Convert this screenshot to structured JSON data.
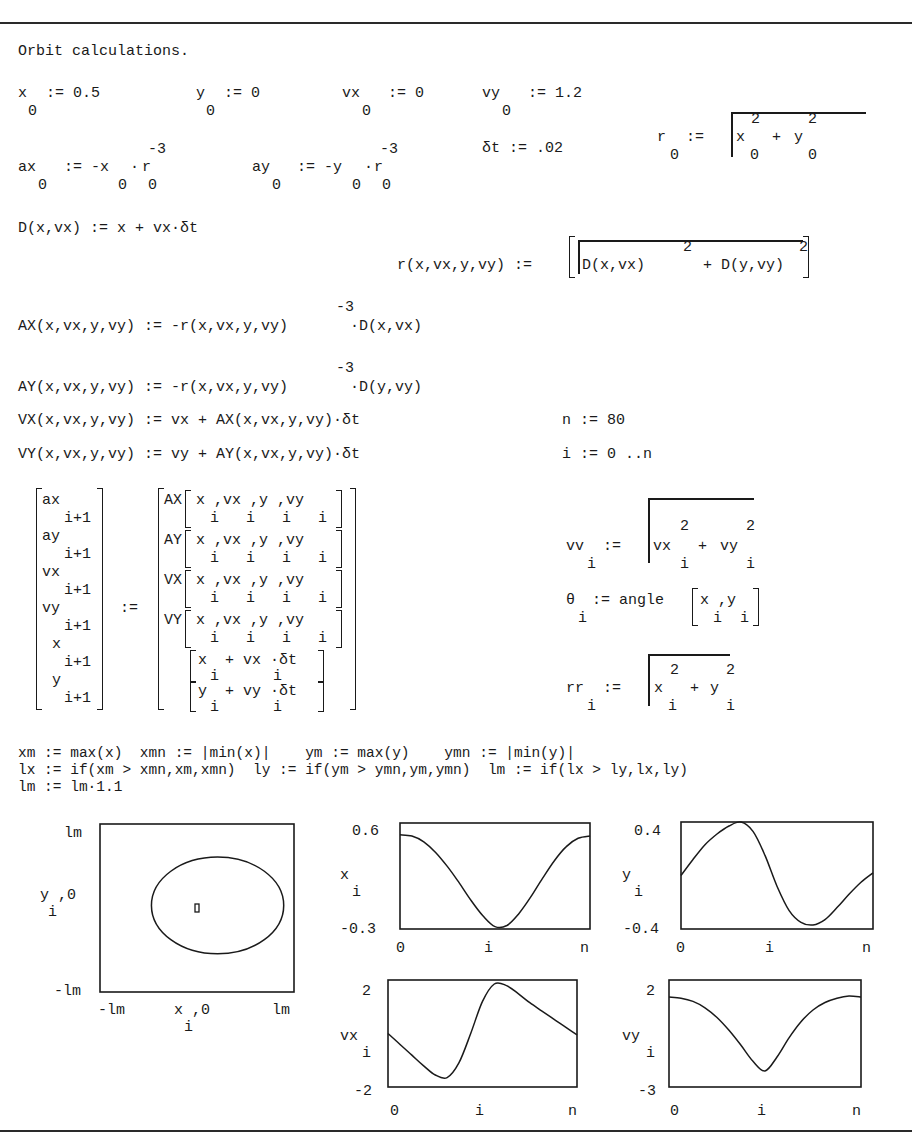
{
  "title": "Orbit calculations.",
  "init": {
    "x0": {
      "name": "x",
      "sub": "0",
      "op": ":= 0.5"
    },
    "y0": {
      "name": "y",
      "sub": "0",
      "op": ":= 0"
    },
    "vx0": {
      "name": "vx",
      "sub": "0",
      "op": ":= 0"
    },
    "vy0": {
      "name": "vy",
      "sub": "0",
      "op": ":= 1.2"
    },
    "r0": {
      "name": "r",
      "sub": "0",
      "op": ":=",
      "term1": "x",
      "term1_sub": "0",
      "term1_sup": "2",
      "plus": "+",
      "term2": "y",
      "term2_sub": "0",
      "term2_sup": "2"
    },
    "dt": "δt := .02",
    "ax0": {
      "name": "ax",
      "sub": "0",
      "body": ":= -x",
      "xsub": "0",
      "dot": "·",
      "r": "r",
      "rsub": "0",
      "exp": "-3"
    },
    "ay0": {
      "name": "ay",
      "sub": "0",
      "body": ":= -y",
      "ysub": "0",
      "dot": "·",
      "r": "r",
      "rsub": "0",
      "exp": "-3"
    }
  },
  "functions": {
    "D": "D(x,vx) := x + vx·δt",
    "r_lhs": "r(x,vx,y,vy) :=",
    "r_t1": "D(x,vx)",
    "r_t2": "+ D(y,vy)",
    "r_sup": "2",
    "AX_lhs": "AX(x,vx,y,vy) := -r(x,vx,y,vy)",
    "AX_rhs": "·D(x,vx)",
    "AY_lhs": "AY(x,vx,y,vy) := -r(x,vx,y,vy)",
    "AY_rhs": "·D(y,vy)",
    "exp": "-3",
    "VX": "VX(x,vx,y,vy) := vx + AX(x,vx,y,vy)·δt",
    "VY": "VY(x,vx,y,vy) := vy + AY(x,vx,y,vy)·δt",
    "n_def": "n := 80",
    "i_def": "i := 0 ..n"
  },
  "matrix": {
    "lhs": [
      "ax",
      "ay",
      "vx",
      "vy",
      "x",
      "y"
    ],
    "lhs_sub": "i+1",
    "assign": ":=",
    "rhs_fn": [
      "AX",
      "AY",
      "VX",
      "VY"
    ],
    "rhs_args": "x ,vx ,y ,vy",
    "rhs_args_sub": "i   i   i   i",
    "rhs_x": "x  + vx ·δt",
    "rhs_y": "y  + vy ·δt",
    "rhs_xy_sub": "i      i"
  },
  "derived": {
    "vv": {
      "name": "vv",
      "sub": "i",
      "op": ":=",
      "t1": "vx",
      "t2": "vy",
      "sup": "2",
      "plus": "+"
    },
    "theta": {
      "name": "θ",
      "sub": "i",
      "op": ":= angle",
      "args": "x ,y",
      "args_sub": "i  i"
    },
    "rr": {
      "name": "rr",
      "sub": "i",
      "op": ":=",
      "t1": "x",
      "t2": "y",
      "sup": "2",
      "plus": "+"
    }
  },
  "limits": {
    "line1": "xm := max(x)  xmn := |min(x)|    ym := max(y)    ymn := |min(y)|",
    "line2": "lx := if(xm > xmn,xm,xmn)  ly := if(ym > ymn,ym,ymn)  lm := if(lx > ly,lx,ly)",
    "line3": "lm := lm·1.1"
  },
  "chart_data": [
    {
      "type": "scatter",
      "title": "orbit",
      "xlabel": "x_i ,0",
      "ylabel": "y_i ,0",
      "xlim": [
        -0.66,
        0.66
      ],
      "ylim": [
        -0.66,
        0.66
      ],
      "xticks": [
        "-lm",
        "lm"
      ],
      "yticks": [
        "lm",
        "-lm"
      ],
      "series": [
        {
          "name": "orbit",
          "shape": "ellipse",
          "cx": 0.14,
          "cy": 0.02,
          "rx": 0.45,
          "ry": 0.38
        },
        {
          "name": "origin",
          "shape": "marker",
          "x": 0,
          "y": 0
        }
      ]
    },
    {
      "type": "line",
      "title": "x vs i",
      "xlabel": "i",
      "ylabel": "x_i",
      "xticks": [
        "0",
        "i",
        "n"
      ],
      "ylim": [
        -0.3,
        0.6
      ],
      "ytick_labels": [
        "0.6",
        "-0.3"
      ],
      "x": [
        0,
        5,
        10,
        15,
        20,
        25,
        30,
        35,
        40,
        45,
        50,
        55,
        60,
        65,
        70,
        75,
        80
      ],
      "values": [
        0.5,
        0.49,
        0.44,
        0.35,
        0.23,
        0.09,
        -0.06,
        -0.19,
        -0.28,
        -0.27,
        -0.17,
        -0.03,
        0.13,
        0.28,
        0.4,
        0.47,
        0.49
      ]
    },
    {
      "type": "line",
      "title": "y vs i",
      "xlabel": "i",
      "ylabel": "y_i",
      "xticks": [
        "0",
        "i",
        "n"
      ],
      "ylim": [
        -0.4,
        0.4
      ],
      "ytick_labels": [
        "0.4",
        "-0.4"
      ],
      "x": [
        0,
        5,
        10,
        15,
        20,
        25,
        30,
        35,
        40,
        45,
        50,
        55,
        60,
        65,
        70,
        75,
        80
      ],
      "values": [
        0.0,
        0.12,
        0.23,
        0.31,
        0.37,
        0.4,
        0.33,
        0.15,
        -0.08,
        -0.26,
        -0.35,
        -0.37,
        -0.33,
        -0.24,
        -0.14,
        -0.05,
        0.02
      ]
    },
    {
      "type": "line",
      "title": "vx vs i",
      "xlabel": "i",
      "ylabel": "vx_i",
      "xticks": [
        "0",
        "i",
        "n"
      ],
      "ylim": [
        -2,
        2
      ],
      "ytick_labels": [
        "2",
        "-2"
      ],
      "x": [
        0,
        5,
        10,
        15,
        20,
        25,
        30,
        35,
        40,
        45,
        50,
        55,
        60,
        65,
        70,
        75,
        80
      ],
      "values": [
        0.0,
        -0.4,
        -0.8,
        -1.2,
        -1.55,
        -1.65,
        -1.1,
        0.0,
        1.2,
        1.85,
        1.8,
        1.5,
        1.15,
        0.85,
        0.55,
        0.25,
        -0.05
      ]
    },
    {
      "type": "line",
      "title": "vy vs i",
      "xlabel": "i",
      "ylabel": "vy_i",
      "xticks": [
        "0",
        "i",
        "n"
      ],
      "ylim": [
        -3,
        2
      ],
      "ytick_labels": [
        "2",
        "-3"
      ],
      "x": [
        0,
        5,
        10,
        15,
        20,
        25,
        30,
        35,
        40,
        45,
        50,
        55,
        60,
        65,
        70,
        75,
        80
      ],
      "values": [
        1.2,
        1.15,
        1.0,
        0.7,
        0.25,
        -0.35,
        -1.05,
        -1.8,
        -2.25,
        -1.6,
        -0.7,
        0.05,
        0.6,
        0.95,
        1.15,
        1.25,
        1.2
      ]
    }
  ]
}
